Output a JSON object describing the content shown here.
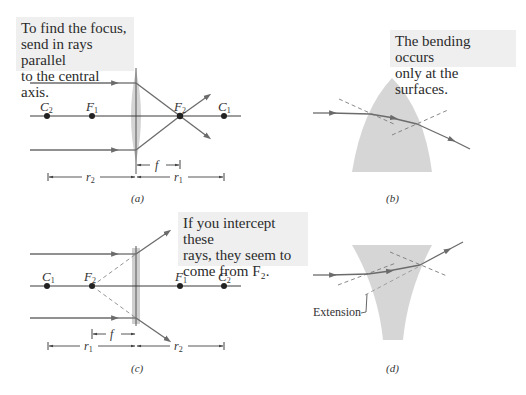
{
  "panels": {
    "a": {
      "caption": "(a)",
      "note": [
        "To find the focus,",
        "send in rays parallel",
        "to the central axis."
      ],
      "points": [
        {
          "name": "C",
          "sub": "2",
          "x": 47
        },
        {
          "name": "F",
          "sub": "1",
          "x": 92
        },
        {
          "name": "F",
          "sub": "2",
          "x": 180
        },
        {
          "name": "C",
          "sub": "1",
          "x": 224
        }
      ],
      "dims": {
        "f": "f",
        "left": {
          "name": "r",
          "sub": "2"
        },
        "right": {
          "name": "r",
          "sub": "1"
        }
      }
    },
    "b": {
      "caption": "(b)",
      "note": [
        "The bending occurs",
        "only at the surfaces."
      ]
    },
    "c": {
      "caption": "(c)",
      "note": [
        "If you intercept these",
        "rays, they seem to",
        "come from F₂."
      ],
      "points": [
        {
          "name": "C",
          "sub": "1",
          "x": 47
        },
        {
          "name": "F",
          "sub": "2",
          "x": 92
        },
        {
          "name": "F",
          "sub": "1",
          "x": 180
        },
        {
          "name": "C",
          "sub": "2",
          "x": 224
        }
      ],
      "dims": {
        "f": "f",
        "left": {
          "name": "r",
          "sub": "1"
        },
        "right": {
          "name": "r",
          "sub": "2"
        }
      }
    },
    "d": {
      "caption": "(d)",
      "extension_label": "Extension"
    }
  },
  "colors": {
    "ray": "#6b6b6b",
    "axis": "#3a3a3a",
    "lens": "#d4d4d4",
    "note_bg": "#efefef",
    "dashed": "#7a7a7a"
  }
}
